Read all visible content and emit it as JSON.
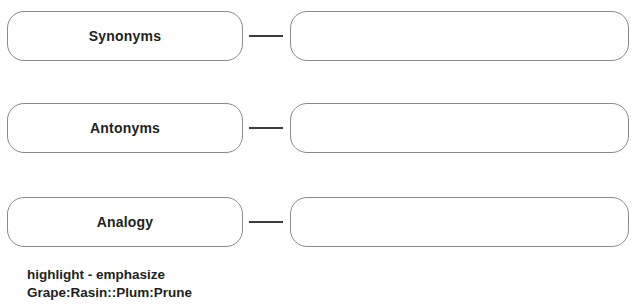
{
  "worksheet": {
    "background_color": "#ffffff",
    "text_color": "#231f20",
    "box_border_color": "#8a8a8a",
    "connector_color": "#3b3b3b",
    "rows": [
      {
        "term": "Synonyms",
        "answer": "",
        "connector": "dash"
      },
      {
        "term": "Antonyms",
        "answer": "",
        "connector": "dash"
      },
      {
        "term": "Analogy",
        "answer": "",
        "connector": "dash"
      }
    ]
  },
  "word_bank": {
    "lines": [
      "highlight - emphasize",
      "Grape:Rasin::Plum:Prune"
    ]
  }
}
